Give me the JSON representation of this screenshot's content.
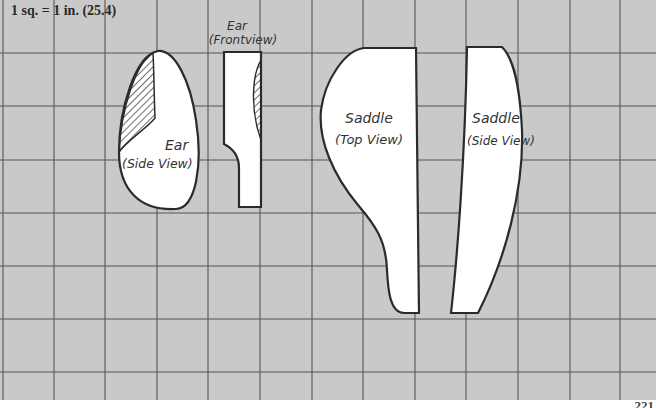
{
  "scale_label": "1 sq. = 1 in. (25.4)",
  "page_number": "221",
  "colors": {
    "grid_background": "#c9c9c9",
    "grid_line": "#555555",
    "outline": "#2b2b2b",
    "part_fill": "#ffffff"
  },
  "grid": {
    "square_size_px": 52,
    "vertical_lines_x": [
      3,
      54,
      105,
      157,
      208,
      260,
      312,
      363,
      415,
      466,
      518,
      570,
      620
    ],
    "horizontal_lines_y": [
      53,
      106,
      160,
      213,
      266,
      319,
      372
    ]
  },
  "parts": [
    {
      "id": "ear-side",
      "label_line1": "Ear",
      "label_line2": "(Side View)",
      "hatched": true
    },
    {
      "id": "ear-front",
      "label_line1": "Ear",
      "label_line2": "(Frontview)",
      "hatched": true
    },
    {
      "id": "saddle-top",
      "label_line1": "Saddle",
      "label_line2": "(Top View)",
      "hatched": false
    },
    {
      "id": "saddle-side",
      "label_line1": "Saddle",
      "label_line2": "(Side View)",
      "hatched": false
    }
  ]
}
